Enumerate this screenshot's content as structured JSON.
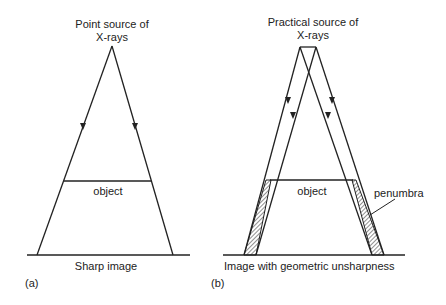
{
  "panel_a": {
    "title_line1": "Point source of",
    "title_line2": "X-rays",
    "object_label": "object",
    "image_label": "Sharp image",
    "panel_tag": "(a)"
  },
  "panel_b": {
    "title_line1": "Practical source of",
    "title_line2": "X-rays",
    "object_label": "object",
    "penumbra_label": "penumbra",
    "image_label": "Image with geometric unsharpness",
    "panel_tag": "(b)"
  },
  "colors": {
    "line": "#222222",
    "background": "#ffffff"
  }
}
